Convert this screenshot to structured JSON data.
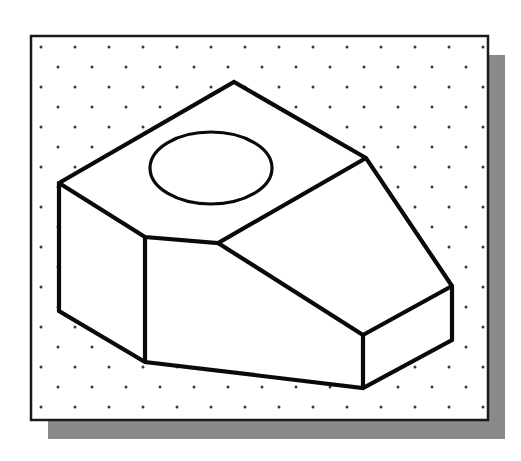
{
  "figure": {
    "canvas": {
      "width": 521,
      "height": 461
    }
  },
  "colors": {
    "page_background": "#ffffff",
    "sheet_fill": "#ffffff",
    "frame_stroke": "#1a1a1a",
    "shadow_fill": "#8a8a8a",
    "grid_dot": "#3a3a3a",
    "object_stroke": "#0a0a0a",
    "hole_stroke": "#0a0a0a"
  },
  "sheet": {
    "name": "grid-sheet",
    "x": 31,
    "y": 36,
    "width": 457,
    "height": 384,
    "border_width": 2.5
  },
  "shadow": {
    "name": "sheet-drop-shadow",
    "offset_x": 17,
    "offset_y": 19,
    "width": 457,
    "height": 384
  },
  "grid": {
    "name": "isometric-dot-grid",
    "pattern": "staggered-isometric",
    "column_spacing": 34,
    "row_spacing": 20,
    "row_offset": 17,
    "dot_radius": 1.5,
    "origin_x": 38,
    "origin_y": 43,
    "columns": 14,
    "rows": 19
  },
  "object": {
    "name": "isometric-solid",
    "stroke_width": 4.2,
    "vertices": {
      "apex_top": [
        234,
        82
      ],
      "left_corner": [
        59,
        183
      ],
      "right_upper": [
        366,
        158
      ],
      "far_right_top": [
        452,
        286
      ],
      "far_right_bottom": [
        452,
        340
      ],
      "mid_junction": [
        218,
        243
      ],
      "mid_left_top": [
        145,
        237
      ],
      "mid_left_bottom": [
        145,
        362
      ],
      "left_bottom": [
        59,
        311
      ],
      "low_junction_top": [
        363,
        335
      ],
      "low_junction_bottom": [
        363,
        388
      ]
    },
    "faces": [
      {
        "name": "top-sloping-face",
        "points": "59,183 234,82 366,158 218,243 145,237"
      },
      {
        "name": "right-sloping-face",
        "points": "366,158 452,286 363,335 218,243"
      },
      {
        "name": "left-vertical-face",
        "points": "59,183 145,237 145,362 59,311"
      },
      {
        "name": "front-lower-face",
        "points": "145,237 218,243 363,335 363,388 145,362"
      },
      {
        "name": "right-end-face",
        "points": "452,286 452,340 363,388 363,335"
      }
    ],
    "edges": [
      {
        "name": "edge-apex-to-left",
        "from": [
          234,
          82
        ],
        "to": [
          59,
          183
        ]
      },
      {
        "name": "edge-apex-to-right-upper",
        "from": [
          234,
          82
        ],
        "to": [
          366,
          158
        ]
      },
      {
        "name": "edge-left-to-midleft",
        "from": [
          59,
          183
        ],
        "to": [
          145,
          237
        ]
      },
      {
        "name": "edge-midleft-to-midjunction",
        "from": [
          145,
          237
        ],
        "to": [
          218,
          243
        ]
      },
      {
        "name": "edge-midjunction-to-right-upper",
        "from": [
          218,
          243
        ],
        "to": [
          366,
          158
        ]
      },
      {
        "name": "edge-right-upper-to-farright",
        "from": [
          366,
          158
        ],
        "to": [
          452,
          286
        ]
      },
      {
        "name": "edge-farright-vertical",
        "from": [
          452,
          286
        ],
        "to": [
          452,
          340
        ]
      },
      {
        "name": "edge-midjunction-to-lowjunction",
        "from": [
          218,
          243
        ],
        "to": [
          363,
          335
        ]
      },
      {
        "name": "edge-farright-to-lowjunction",
        "from": [
          452,
          286
        ],
        "to": [
          363,
          335
        ]
      },
      {
        "name": "edge-lowjunction-vertical",
        "from": [
          363,
          335
        ],
        "to": [
          363,
          388
        ]
      },
      {
        "name": "edge-farright-bottom-to-lowjunction-bottom",
        "from": [
          452,
          340
        ],
        "to": [
          363,
          388
        ]
      },
      {
        "name": "edge-midleft-vertical",
        "from": [
          145,
          237
        ],
        "to": [
          145,
          362
        ]
      },
      {
        "name": "edge-bottom-front",
        "from": [
          145,
          362
        ],
        "to": [
          363,
          388
        ]
      },
      {
        "name": "edge-left-vertical",
        "from": [
          59,
          183
        ],
        "to": [
          59,
          311
        ]
      },
      {
        "name": "edge-leftbottom-to-midleftbottom",
        "from": [
          59,
          311
        ],
        "to": [
          145,
          362
        ]
      }
    ]
  },
  "hole": {
    "name": "circular-through-hole-ellipse",
    "center_x": 211,
    "center_y": 168,
    "radius_x": 61,
    "radius_y": 36,
    "stroke_width": 3.2
  }
}
